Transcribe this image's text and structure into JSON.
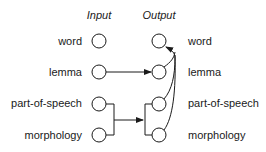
{
  "headers": {
    "input": "Input",
    "output": "Output"
  },
  "rows": [
    {
      "label_left": "word",
      "label_right": "word"
    },
    {
      "label_left": "lemma",
      "label_right": "lemma"
    },
    {
      "label_left": "part-of-speech",
      "label_right": "part-of-speech"
    },
    {
      "label_left": "morphology",
      "label_right": "morphology"
    }
  ],
  "edges": [
    {
      "from": "input.lemma",
      "to": "output.lemma",
      "type": "straight-arrow"
    },
    {
      "from": [
        "input.part-of-speech",
        "input.morphology"
      ],
      "to": [
        "output.part-of-speech",
        "output.morphology"
      ],
      "type": "bracket-arrow"
    },
    {
      "from": [
        "output.lemma",
        "output.part-of-speech",
        "output.morphology"
      ],
      "to": "output.word",
      "type": "curved-arrow"
    }
  ],
  "colors": {
    "stroke": "#1a1a1a",
    "background": "#ffffff"
  }
}
